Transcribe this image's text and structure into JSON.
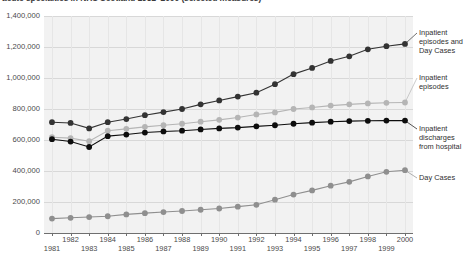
{
  "chart_data": {
    "type": "line",
    "title": "acute specialties in NHS Scotland 1981–2000 (selected measures)",
    "xlabel": "",
    "ylabel": "",
    "ylim": [
      0,
      1400000
    ],
    "ytick_labels": [
      "1,400,000",
      "1,200,000",
      "1,000,000",
      "800,000",
      "600,000",
      "400,000",
      "200,000",
      "0"
    ],
    "ytick_values": [
      1400000,
      1200000,
      1000000,
      800000,
      600000,
      400000,
      200000,
      0
    ],
    "grid": true,
    "legend_position": "right",
    "x": [
      1981,
      1982,
      1983,
      1984,
      1985,
      1986,
      1987,
      1988,
      1989,
      1990,
      1991,
      1992,
      1993,
      1994,
      1995,
      1996,
      1997,
      1998,
      1999,
      2000
    ],
    "categories": [
      "1981",
      "1982",
      "1983",
      "1984",
      "1985",
      "1986",
      "1987",
      "1988",
      "1989",
      "1990",
      "1991",
      "1992",
      "1993",
      "1994",
      "1995",
      "1996",
      "1997",
      "1998",
      "1999",
      "2000"
    ],
    "series": [
      {
        "name": "Inpatient episodes and Day Cases",
        "color": "#333333",
        "marker": "circle",
        "values": [
          715000,
          710000,
          675000,
          715000,
          735000,
          760000,
          780000,
          800000,
          830000,
          855000,
          880000,
          905000,
          960000,
          1025000,
          1065000,
          1110000,
          1140000,
          1185000,
          1205000,
          1220000
        ]
      },
      {
        "name": "Inpatient episodes",
        "color": "#b5b5b5",
        "marker": "circle",
        "values": [
          618000,
          612000,
          592000,
          660000,
          672000,
          685000,
          695000,
          705000,
          718000,
          730000,
          745000,
          765000,
          778000,
          800000,
          810000,
          822000,
          830000,
          836000,
          840000,
          842000
        ]
      },
      {
        "name": "Inpatient discharges from hospital",
        "color": "#0d0d0d",
        "marker": "circle",
        "values": [
          605000,
          590000,
          555000,
          625000,
          635000,
          648000,
          655000,
          660000,
          668000,
          675000,
          680000,
          688000,
          695000,
          705000,
          712000,
          718000,
          722000,
          724000,
          725000,
          725000
        ]
      },
      {
        "name": "Day Cases",
        "color": "#8f8f8f",
        "marker": "circle",
        "values": [
          93000,
          98000,
          103000,
          108000,
          120000,
          128000,
          135000,
          142000,
          150000,
          158000,
          170000,
          182000,
          215000,
          248000,
          275000,
          305000,
          330000,
          365000,
          395000,
          405000
        ]
      }
    ]
  },
  "legend": {
    "items": [
      {
        "label": "Inpatient episodes and Day Cases"
      },
      {
        "label": "Inpatient episodes"
      },
      {
        "label": "Inpatient discharges from hospital"
      },
      {
        "label": "Day Cases"
      }
    ]
  }
}
